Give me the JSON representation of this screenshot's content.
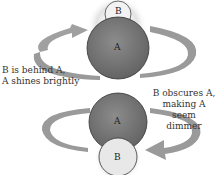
{
  "diagram": {
    "top_scene": {
      "star_a_label": "A",
      "star_b_label": "B",
      "caption": [
        "B is behind A,",
        "A shines brightly"
      ]
    },
    "bottom_scene": {
      "star_a_label": "A",
      "star_b_label": "B",
      "caption": [
        "B obscures A,",
        "making A seem",
        "dimmer"
      ]
    },
    "colors": {
      "star_a": "#7a7a7a",
      "star_b": "#e6e6e6",
      "orbit_arrow": "#9a9a9a",
      "text": "#333333"
    }
  }
}
